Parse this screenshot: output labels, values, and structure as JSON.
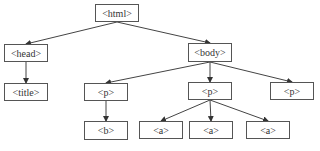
{
  "diagram": {
    "type": "tree",
    "nodes": [
      {
        "id": "html",
        "label": "<html>",
        "x": 95,
        "y": 4,
        "w": 44,
        "h": 18
      },
      {
        "id": "head",
        "label": "<head>",
        "x": 4,
        "y": 44,
        "w": 44,
        "h": 18
      },
      {
        "id": "body",
        "label": "<body>",
        "x": 188,
        "y": 43,
        "w": 44,
        "h": 19
      },
      {
        "id": "title",
        "label": "<title>",
        "x": 4,
        "y": 83,
        "w": 44,
        "h": 18
      },
      {
        "id": "p1",
        "label": "<p>",
        "x": 84,
        "y": 83,
        "w": 44,
        "h": 18
      },
      {
        "id": "p2",
        "label": "<p>",
        "x": 188,
        "y": 82,
        "w": 44,
        "h": 18
      },
      {
        "id": "p3",
        "label": "<p>",
        "x": 270,
        "y": 82,
        "w": 44,
        "h": 18
      },
      {
        "id": "b",
        "label": "<b>",
        "x": 84,
        "y": 121,
        "w": 44,
        "h": 19
      },
      {
        "id": "a1",
        "label": "<a>",
        "x": 139,
        "y": 121,
        "w": 44,
        "h": 18
      },
      {
        "id": "a2",
        "label": "<a>",
        "x": 189,
        "y": 121,
        "w": 44,
        "h": 18
      },
      {
        "id": "a3",
        "label": "<a>",
        "x": 246,
        "y": 121,
        "w": 44,
        "h": 18
      }
    ],
    "edges": [
      {
        "from": "html",
        "to": "head"
      },
      {
        "from": "html",
        "to": "body"
      },
      {
        "from": "head",
        "to": "title"
      },
      {
        "from": "body",
        "to": "p1"
      },
      {
        "from": "body",
        "to": "p2"
      },
      {
        "from": "body",
        "to": "p3"
      },
      {
        "from": "p1",
        "to": "b"
      },
      {
        "from": "p2",
        "to": "a1"
      },
      {
        "from": "p2",
        "to": "a2"
      },
      {
        "from": "p2",
        "to": "a3"
      }
    ],
    "colors": {
      "line": "#444444",
      "border": "#555555",
      "text": "#333333"
    }
  }
}
